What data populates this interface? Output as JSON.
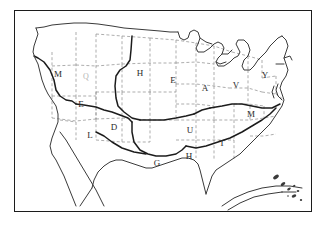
{
  "figure": {
    "kind": "line-art-map",
    "frame": {
      "visible": true,
      "color": "#1c1c1c"
    },
    "background_color": "#ffffff",
    "line_colors": {
      "coastline": "#3a3a3a",
      "state_border": "#8a8a8a",
      "region_border": "#1c1c1c",
      "frame": "#1c1c1c"
    }
  },
  "labels": [
    {
      "id": "label-m-northwest",
      "text": "M",
      "x": 58,
      "y": 74,
      "faint": false
    },
    {
      "id": "label-q-interior",
      "text": "Q",
      "x": 86,
      "y": 76,
      "faint": true
    },
    {
      "id": "label-h-plains",
      "text": "H",
      "x": 140,
      "y": 73,
      "faint": false
    },
    {
      "id": "label-e-midwest",
      "text": "E",
      "x": 173,
      "y": 80,
      "faint": false
    },
    {
      "id": "label-a-ohio",
      "text": "A",
      "x": 205,
      "y": 88,
      "faint": false
    },
    {
      "id": "label-v-appal",
      "text": "V",
      "x": 236,
      "y": 85,
      "faint": false
    },
    {
      "id": "label-y-northeast",
      "text": "Y",
      "x": 265,
      "y": 75,
      "faint": false
    },
    {
      "id": "label-e-greatbasin",
      "text": "E",
      "x": 81,
      "y": 104,
      "faint": false
    },
    {
      "id": "label-m-carolina",
      "text": "M",
      "x": 251,
      "y": 114,
      "faint": false
    },
    {
      "id": "label-d-southwest",
      "text": "D",
      "x": 114,
      "y": 127,
      "faint": false
    },
    {
      "id": "label-l-desert",
      "text": "L",
      "x": 90,
      "y": 135,
      "faint": false
    },
    {
      "id": "label-u-tennessee",
      "text": "U",
      "x": 190,
      "y": 130,
      "faint": false
    },
    {
      "id": "label-t-southeast",
      "text": "T",
      "x": 222,
      "y": 143,
      "faint": false
    },
    {
      "id": "label-g-texas",
      "text": "G",
      "x": 157,
      "y": 163,
      "faint": false
    },
    {
      "id": "label-h-gulf",
      "text": "H",
      "x": 189,
      "y": 156,
      "faint": false
    }
  ],
  "insets": [
    {
      "id": "inset-hawaii",
      "name": "hawaii-islands"
    },
    {
      "id": "inset-gulf-arc",
      "name": "gulf-caribbean-arc"
    }
  ]
}
